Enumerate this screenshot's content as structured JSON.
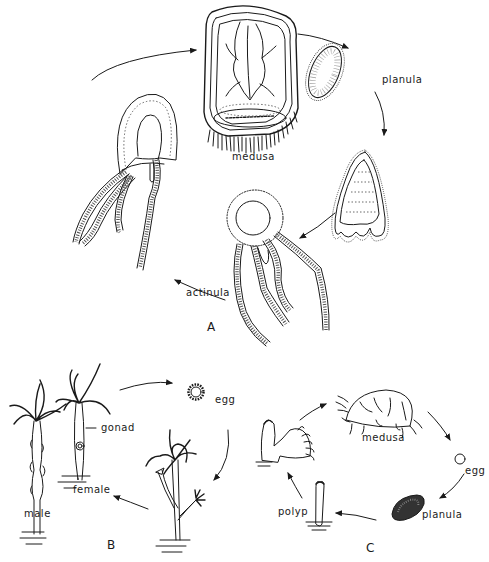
{
  "figure": {
    "panels": [
      {
        "id": "A",
        "label": "A",
        "stages": [
          {
            "name": "medusa",
            "label": "medusa"
          },
          {
            "name": "planula",
            "label": "planula"
          },
          {
            "name": "larva",
            "label": ""
          },
          {
            "name": "actinula",
            "label": "actinula"
          },
          {
            "name": "juvenile",
            "label": ""
          }
        ]
      },
      {
        "id": "B",
        "label": "B",
        "stages": [
          {
            "name": "male",
            "label": "male"
          },
          {
            "name": "female",
            "label": "female"
          },
          {
            "name": "gonad",
            "label": "gonad"
          },
          {
            "name": "egg",
            "label": "egg"
          },
          {
            "name": "budding-polyp",
            "label": ""
          }
        ]
      },
      {
        "id": "C",
        "label": "C",
        "stages": [
          {
            "name": "medusa",
            "label": "medusa"
          },
          {
            "name": "egg",
            "label": "egg"
          },
          {
            "name": "planula",
            "label": "planula"
          },
          {
            "name": "polyp",
            "label": "polyp"
          },
          {
            "name": "budding-polyp",
            "label": ""
          }
        ]
      }
    ],
    "colors": {
      "ink": "#1a1a1a",
      "background": "#ffffff"
    }
  }
}
